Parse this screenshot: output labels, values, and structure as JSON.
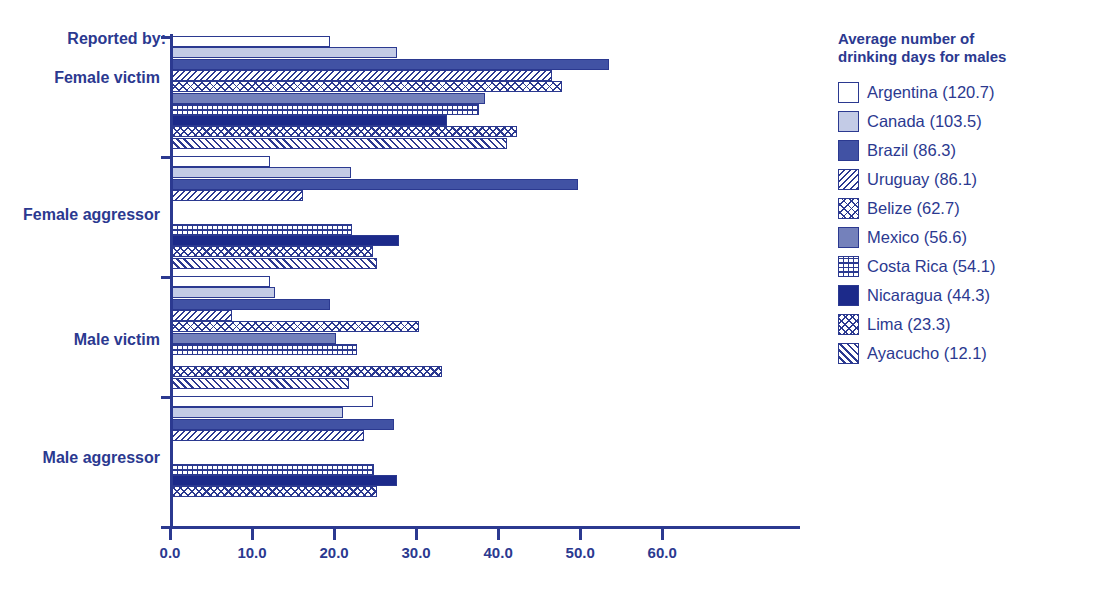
{
  "title_sliver": "",
  "axis": {
    "y_label_prefix": "Reported by:",
    "x_ticks": [
      "0.0",
      "10.0",
      "20.0",
      "30.0",
      "40.0",
      "50.0",
      "60.0"
    ]
  },
  "legend": {
    "title": "Average number of\ndrinking days for males",
    "items": [
      {
        "label": "Argentina (120.7)",
        "pattern": "p-white",
        "value": 120.7
      },
      {
        "label": "Canada (103.5)",
        "pattern": "p-light",
        "value": 103.5
      },
      {
        "label": "Brazil (86.3)",
        "pattern": "p-darkblue",
        "value": 86.3
      },
      {
        "label": "Uruguay (86.1)",
        "pattern": "p-diag",
        "value": 86.1
      },
      {
        "label": "Belize (62.7)",
        "pattern": "p-diamond",
        "value": 62.7
      },
      {
        "label": "Mexico (56.6)",
        "pattern": "p-medblue",
        "value": 56.6
      },
      {
        "label": "Costa Rica (54.1)",
        "pattern": "p-grid",
        "value": 54.1
      },
      {
        "label": "Nicaragua (44.3)",
        "pattern": "p-navy",
        "value": 44.3
      },
      {
        "label": "Lima (23.3)",
        "pattern": "p-chevron",
        "value": 23.3
      },
      {
        "label": "Ayacucho (12.1)",
        "pattern": "p-diag2",
        "value": 12.1
      }
    ]
  },
  "colors": {
    "brand_blue": "#2b3990",
    "dark_blue": "#4152a4",
    "medium_blue": "#7481bb",
    "light_blue": "#c3cbe6",
    "navy": "#1c2a8a",
    "background": "#ffffff"
  },
  "chart_data": {
    "type": "bar",
    "orientation": "horizontal",
    "title": "",
    "xlabel": "",
    "ylabel": "Reported by:",
    "xlim": [
      0,
      76.8
    ],
    "grid": false,
    "legend_position": "right",
    "legend_title": "Average number of drinking days for males",
    "xticks": [
      0.0,
      10.0,
      20.0,
      30.0,
      40.0,
      50.0,
      60.0
    ],
    "categories": [
      "Female victim",
      "Female aggressor",
      "Male victim",
      "Male aggressor"
    ],
    "series": [
      {
        "name": "Argentina",
        "values": [
          19.3,
          12.0,
          12.0,
          24.5
        ]
      },
      {
        "name": "Canada",
        "values": [
          27.4,
          21.8,
          12.5,
          20.9
        ]
      },
      {
        "name": "Brazil",
        "values": [
          53.3,
          49.5,
          19.2,
          27.1
        ]
      },
      {
        "name": "Uruguay",
        "values": [
          46.3,
          16.0,
          7.3,
          23.4
        ]
      },
      {
        "name": "Belize",
        "values": [
          47.5,
          0.0,
          30.1,
          0.0
        ]
      },
      {
        "name": "Mexico",
        "values": [
          38.2,
          0.0,
          20.0,
          0.0
        ]
      },
      {
        "name": "Costa Rica",
        "values": [
          37.4,
          22.0,
          22.5,
          24.6
        ]
      },
      {
        "name": "Nicaragua",
        "values": [
          33.5,
          27.7,
          0.0,
          27.4
        ]
      },
      {
        "name": "Lima",
        "values": [
          42.0,
          24.5,
          32.9,
          25.0
        ]
      },
      {
        "name": "Ayacucho",
        "values": [
          40.8,
          25.0,
          21.6,
          0.0
        ]
      }
    ]
  }
}
